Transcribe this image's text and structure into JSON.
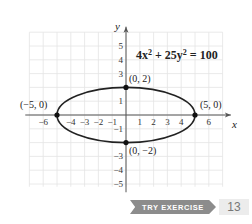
{
  "chart_data": {
    "type": "line",
    "equation": {
      "a": 4,
      "b": 25,
      "c": 100
    },
    "curve": "ellipse",
    "xlabel": "x",
    "ylabel": "y",
    "xlim": [
      -7,
      7
    ],
    "ylim": [
      -5.5,
      6
    ],
    "grid": true,
    "x_ticks": [
      -6,
      -4,
      -3,
      -2,
      -1,
      1,
      2,
      3,
      4,
      6
    ],
    "y_ticks": [
      5,
      4,
      3,
      1,
      -1,
      -3,
      -4,
      -5
    ],
    "points": [
      {
        "x": -5,
        "y": 0,
        "label": "(−5, 0)"
      },
      {
        "x": 5,
        "y": 0,
        "label": "(5, 0)"
      },
      {
        "x": 0,
        "y": 2,
        "label": "(0, 2)"
      },
      {
        "x": 0,
        "y": -2,
        "label": "(0, −2)"
      }
    ],
    "semi_axes": {
      "horizontal": 5,
      "vertical": 2
    }
  },
  "labels": {
    "equation_display": "4x² + 25y² = 100",
    "x_axis": "x",
    "y_axis": "y"
  },
  "badge": {
    "label": "TRY EXERCISE",
    "number": "13"
  }
}
